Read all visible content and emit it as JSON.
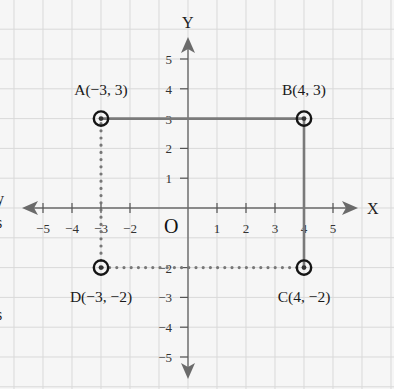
{
  "diagram": {
    "type": "coordinate-plane",
    "axes": {
      "x_label": "X",
      "y_label": "Y",
      "origin_label": "O",
      "x_range": [
        -5,
        5
      ],
      "y_range": [
        -5,
        5
      ],
      "x_ticks": [
        "-5",
        "-4",
        "-3",
        "-2",
        "1",
        "2",
        "3",
        "4",
        "5"
      ],
      "y_ticks": [
        "5",
        "4",
        "3",
        "2",
        "1",
        "-2",
        "-3",
        "-4",
        "-5"
      ]
    },
    "points": [
      {
        "name": "A",
        "x": -3,
        "y": 3,
        "label": "A(−3, 3)"
      },
      {
        "name": "B",
        "x": 4,
        "y": 3,
        "label": "B(4, 3)"
      },
      {
        "name": "C",
        "x": 4,
        "y": -2,
        "label": "C(4, −2)"
      },
      {
        "name": "D",
        "x": -3,
        "y": -2,
        "label": "D(−3, −2)"
      }
    ],
    "segments": [
      {
        "from": "A",
        "to": "B",
        "style": "solid"
      },
      {
        "from": "B",
        "to": "C",
        "style": "solid"
      },
      {
        "from": "C",
        "to": "D",
        "style": "dotted"
      },
      {
        "from": "D",
        "to": "A",
        "style": "dotted"
      }
    ],
    "edge_fragments": [
      "y",
      "s",
      "s"
    ],
    "colors": {
      "background": "#f6f6f6",
      "grid": "#d9d9d9",
      "axis": "#6b6b6b",
      "solid_segment": "#7a7a7a",
      "dotted_segment": "#777777",
      "marker": "#151515"
    }
  }
}
